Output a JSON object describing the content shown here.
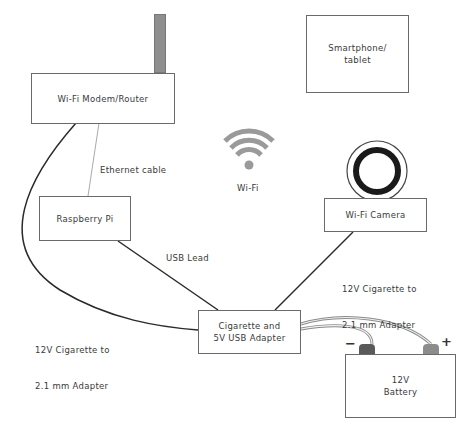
{
  "diagram": {
    "nodes": {
      "router": {
        "label": "Wi-Fi Modem/Router"
      },
      "smartphone": {
        "label_line1": "Smartphone/",
        "label_line2": "tablet"
      },
      "raspberry_pi": {
        "label": "Raspberry Pi"
      },
      "camera": {
        "label": "Wi-Fi Camera"
      },
      "cigarette_adapter": {
        "label_line1": "Cigarette and",
        "label_line2": "5V USB Adapter"
      },
      "battery": {
        "label_line1": "12V",
        "label_line2": "Battery",
        "negative_sign": "−",
        "positive_sign": "+"
      }
    },
    "wifi": {
      "label": "Wi-Fi"
    },
    "edges": {
      "ethernet": {
        "label": "Ethernet cable"
      },
      "usb_lead": {
        "label": "USB Lead"
      },
      "router_adapter": {
        "label_line1": "12V Cigarette to",
        "label_line2": "2.1 mm Adapter"
      },
      "camera_adapter": {
        "label_line1": "12V Cigarette to",
        "label_line2": "2.1 mm Adapter"
      }
    },
    "colors": {
      "line": "#2a2a2a",
      "box_border": "#6a6a6a",
      "ethernet_line": "#aaaaaa",
      "wifi_icon": "#9a9a9a",
      "antenna": "#8f8f8f",
      "terminal_negative": "#5a5a5a",
      "terminal_positive": "#8c8c8c"
    }
  }
}
